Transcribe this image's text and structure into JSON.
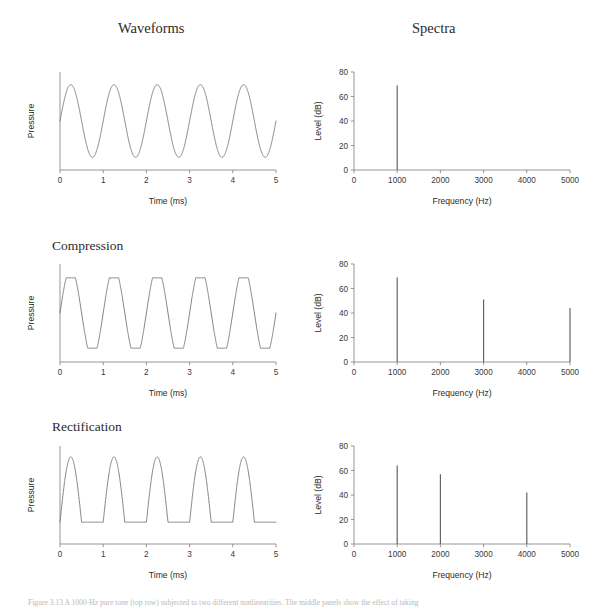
{
  "figure": {
    "columns": [
      {
        "id": "waveforms",
        "label": "Waveforms"
      },
      {
        "id": "spectra",
        "label": "Spectra"
      }
    ],
    "row_labels": {
      "compression": "Compression",
      "rectification": "Rectification"
    },
    "caption": "Figure 3.13  A 1000-Hz pure tone (top row) subjected to two different nonlinearities. The middle panels show the effect of taking",
    "trace_color": "#6e6e6e",
    "axis_color": "#8a8a8a",
    "background": "#ffffff"
  },
  "chart_data": [
    {
      "type": "line",
      "id": "waveform-pure-tone",
      "title": "",
      "row": "pure-tone",
      "column": "waveforms",
      "xlabel": "Time (ms)",
      "ylabel": "Pressure",
      "xlim": [
        0,
        5
      ],
      "ylim": [
        -1.35,
        1.35
      ],
      "xticks": [
        0,
        1,
        2,
        3,
        4,
        5
      ],
      "xticklabels": [
        "0",
        "1",
        "2",
        "3",
        "4",
        "5"
      ],
      "yticks": [],
      "yticklabels": [],
      "grid": false,
      "waveform": {
        "kind": "sine",
        "frequency_hz": 1000,
        "cycles": 5,
        "amplitude": 1.0,
        "phase_deg": 0,
        "clip_level": null,
        "rectify": false
      }
    },
    {
      "type": "line",
      "id": "spectrum-pure-tone",
      "row": "pure-tone",
      "column": "spectra",
      "xlabel": "Frequency (Hz)",
      "ylabel": "Level (dB)",
      "xlim": [
        0,
        5000
      ],
      "ylim": [
        0,
        80
      ],
      "xticks": [
        0,
        1000,
        2000,
        3000,
        4000,
        5000
      ],
      "xticklabels": [
        "0",
        "1000",
        "2000",
        "3000",
        "4000",
        "5000"
      ],
      "yticks": [
        0,
        20,
        40,
        60,
        80
      ],
      "yticklabels": [
        "0",
        "20",
        "40",
        "60",
        "80"
      ],
      "grid": false,
      "frequencies_hz": [
        1000
      ],
      "levels_db": [
        69
      ]
    },
    {
      "type": "line",
      "id": "waveform-compression",
      "row": "compression",
      "column": "waveforms",
      "xlabel": "Time (ms)",
      "ylabel": "Pressure",
      "xlim": [
        0,
        5
      ],
      "ylim": [
        -1.35,
        1.35
      ],
      "xticks": [
        0,
        1,
        2,
        3,
        4,
        5
      ],
      "xticklabels": [
        "0",
        "1",
        "2",
        "3",
        "4",
        "5"
      ],
      "yticks": [],
      "yticklabels": [],
      "grid": false,
      "waveform": {
        "kind": "compressed-sine",
        "frequency_hz": 1000,
        "cycles": 5,
        "amplitude": 1.0,
        "phase_deg": 0,
        "clip_level": 0.78,
        "rectify": false
      }
    },
    {
      "type": "line",
      "id": "spectrum-compression",
      "row": "compression",
      "column": "spectra",
      "xlabel": "Frequency (Hz)",
      "ylabel": "Level (dB)",
      "xlim": [
        0,
        5000
      ],
      "ylim": [
        0,
        80
      ],
      "xticks": [
        0,
        1000,
        2000,
        3000,
        4000,
        5000
      ],
      "xticklabels": [
        "0",
        "1000",
        "2000",
        "3000",
        "4000",
        "5000"
      ],
      "yticks": [
        0,
        20,
        40,
        60,
        80
      ],
      "yticklabels": [
        "0",
        "20",
        "40",
        "60",
        "80"
      ],
      "grid": false,
      "frequencies_hz": [
        1000,
        3000,
        5000
      ],
      "levels_db": [
        69,
        51,
        44
      ]
    },
    {
      "type": "line",
      "id": "waveform-rectification",
      "row": "rectification",
      "column": "waveforms",
      "xlabel": "Time (ms)",
      "ylabel": "Pressure",
      "xlim": [
        0,
        5
      ],
      "ylim": [
        -1.35,
        1.35
      ],
      "xticks": [
        0,
        1,
        2,
        3,
        4,
        5
      ],
      "xticklabels": [
        "0",
        "1",
        "2",
        "3",
        "4",
        "5"
      ],
      "yticks": [],
      "yticklabels": [],
      "grid": false,
      "waveform": {
        "kind": "half-wave-rectified-sine",
        "frequency_hz": 1000,
        "cycles": 5,
        "amplitude": 1.0,
        "phase_deg": 0,
        "clip_level": null,
        "rectify": true
      }
    },
    {
      "type": "line",
      "id": "spectrum-rectification",
      "row": "rectification",
      "column": "spectra",
      "xlabel": "Frequency (Hz)",
      "ylabel": "Level (dB)",
      "xlim": [
        0,
        5000
      ],
      "ylim": [
        0,
        80
      ],
      "xticks": [
        0,
        1000,
        2000,
        3000,
        4000,
        5000
      ],
      "xticklabels": [
        "0",
        "1000",
        "2000",
        "3000",
        "4000",
        "5000"
      ],
      "yticks": [
        0,
        20,
        40,
        60,
        80
      ],
      "yticklabels": [
        "0",
        "20",
        "40",
        "60",
        "80"
      ],
      "grid": false,
      "frequencies_hz": [
        1000,
        2000,
        4000
      ],
      "levels_db": [
        64,
        57,
        42
      ]
    }
  ]
}
